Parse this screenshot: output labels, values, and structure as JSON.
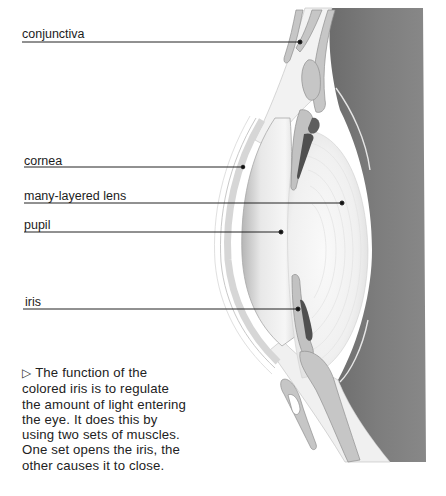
{
  "diagram": {
    "labels": [
      {
        "id": "conjunctiva",
        "text": "conjunctiva",
        "text_x": 22,
        "text_y": 27,
        "line_y": 42,
        "dot_x": 300,
        "dot_y": 42
      },
      {
        "id": "cornea",
        "text": "cornea",
        "text_x": 24,
        "text_y": 154,
        "line_y": 167,
        "dot_x": 243,
        "dot_y": 167
      },
      {
        "id": "lens",
        "text": "many-layered lens",
        "text_x": 24,
        "text_y": 189,
        "line_y": 203,
        "dot_x": 342,
        "dot_y": 203
      },
      {
        "id": "pupil",
        "text": "pupil",
        "text_x": 24,
        "text_y": 218,
        "line_y": 232,
        "dot_x": 281,
        "dot_y": 232
      },
      {
        "id": "iris",
        "text": "iris",
        "text_x": 25,
        "text_y": 295,
        "line_y": 309,
        "dot_x": 298,
        "dot_y": 309
      }
    ],
    "caption": {
      "marker": "▷",
      "lines": [
        "The function of the",
        "colored iris is to regulate",
        "the amount of light entering",
        "the eye. It does this by",
        "using two sets of muscles.",
        "One set opens the iris, the",
        "other causes it to close."
      ]
    },
    "colors": {
      "background": "#ffffff",
      "eye_interior": "#7a7a7a",
      "tissue": "#c8c8c8",
      "tissue_outline": "#9a9a9a",
      "lens": "#f4f4f4",
      "leader_line": "#222222"
    }
  }
}
